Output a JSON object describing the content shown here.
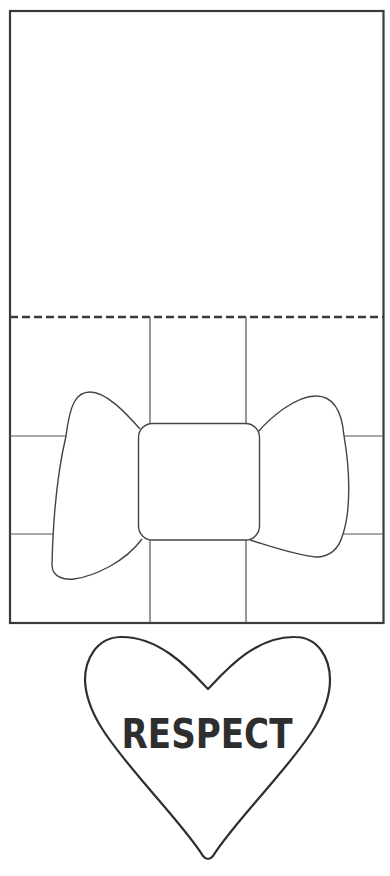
{
  "template": {
    "card": {
      "outline_color": "#3a3a3a",
      "fold_line_style": "dashed",
      "panels": [
        "card-top-panel",
        "gift-box-panel"
      ]
    },
    "gift_box": {
      "ribbon": "vertical and horizontal ribbon bands",
      "bow": {
        "left_wing": "bow-left-wing",
        "knot": "bow-knot",
        "right_wing": "bow-right-wing"
      }
    },
    "heart": {
      "label": "RESPECT",
      "text_color": "#2e2e2e",
      "outline_color": "#2e2e2e"
    }
  }
}
